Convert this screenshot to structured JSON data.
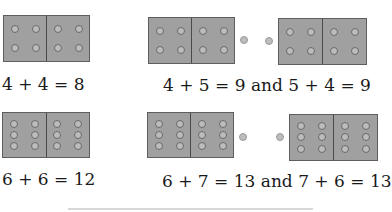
{
  "figure": {
    "examples": [
      {
        "id": "double-4",
        "dominoes": [
          {
            "left_pips": 4,
            "right_pips": 4
          }
        ],
        "loose_pips": 0,
        "equation": "4 + 4 = 8"
      },
      {
        "id": "near-double-4-5",
        "dominoes": [
          {
            "left_pips": 4,
            "right_pips": 4
          },
          {
            "left_pips": 4,
            "right_pips": 4
          }
        ],
        "loose_pips": 2,
        "equation": "4 + 5 = 9 and 5 + 4 = 9"
      },
      {
        "id": "double-6",
        "dominoes": [
          {
            "left_pips": 6,
            "right_pips": 6
          }
        ],
        "loose_pips": 0,
        "equation": "6 + 6 = 12"
      },
      {
        "id": "near-double-6-7",
        "dominoes": [
          {
            "left_pips": 6,
            "right_pips": 6
          },
          {
            "left_pips": 6,
            "right_pips": 6
          }
        ],
        "loose_pips": 2,
        "equation": "6 + 7 = 13 and 7 + 6 = 13"
      }
    ],
    "colors": {
      "domino_fill": "#a0a0a0",
      "domino_border": "#5e5e5e",
      "pip_fill": "#bcbcbc",
      "pip_ring": "#6a6a6a",
      "text": "#1a1a1a"
    }
  }
}
